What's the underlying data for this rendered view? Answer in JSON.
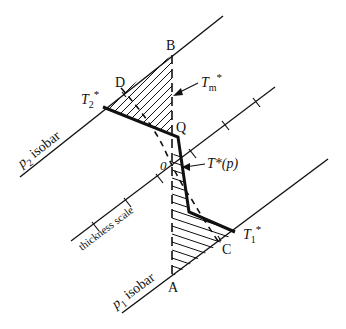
{
  "diagram": {
    "colors": {
      "ink": "#111111",
      "background": "#ffffff",
      "scale_text": "#555555"
    },
    "labels": {
      "B": "B",
      "D": "D",
      "Q": "Q",
      "O": "0",
      "C": "C",
      "A": "A",
      "T2": "T",
      "T2_sub": "2",
      "T2_star": "*",
      "T1": "T",
      "T1_sub": "1",
      "T1_star": "*",
      "Tm": "T",
      "Tm_sub": "m",
      "Tm_star": "*",
      "Tp": "T*(p)",
      "p2": "p",
      "p2_sub": "2",
      "p2_rest": " isobar",
      "p1": "p",
      "p1_sub": "1",
      "p1_rest": " isobar",
      "thickness_scale": "thickness scale"
    }
  }
}
